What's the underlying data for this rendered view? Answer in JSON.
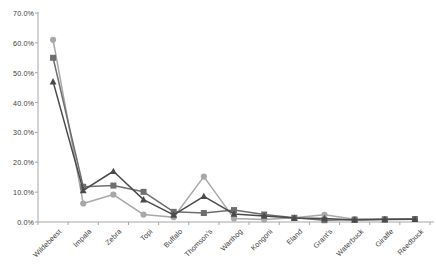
{
  "chart_data": {
    "type": "line",
    "title": "",
    "subtitle": "",
    "xlabel": "",
    "ylabel": "",
    "ylim": [
      0,
      70
    ],
    "ytick_labels": [
      "0.0%",
      "10.0%",
      "20.0%",
      "30.0%",
      "40.0%",
      "50.0%",
      "60.0%",
      "70.0%"
    ],
    "ytick_values": [
      0,
      10,
      20,
      30,
      40,
      50,
      60,
      70
    ],
    "grid": false,
    "legend_position": "none",
    "categories": [
      "Wildebeest",
      "Impala",
      "Zebra",
      "Topi",
      "Buffalo",
      "Thomson's",
      "Warthog",
      "Kongoni",
      "Eland",
      "Grant's",
      "Waterbuck",
      "Giraffe",
      "Reedbuck"
    ],
    "series": [
      {
        "name": "series-1",
        "marker": "circle",
        "color": "#a8a8a8",
        "values": [
          61.0,
          6.2,
          9.2,
          2.5,
          1.6,
          15.2,
          1.2,
          0.8,
          1.4,
          2.4,
          0.9,
          1.0,
          1.0
        ]
      },
      {
        "name": "series-2",
        "marker": "square",
        "color": "#6e6e6e",
        "values": [
          55.0,
          11.8,
          12.2,
          10.1,
          3.4,
          3.0,
          4.0,
          2.5,
          1.4,
          0.6,
          0.8,
          0.9,
          1.0
        ]
      },
      {
        "name": "series-3",
        "marker": "triangle",
        "color": "#4a4a4a",
        "values": [
          47.0,
          10.6,
          17.0,
          7.5,
          2.4,
          8.6,
          2.7,
          2.0,
          1.3,
          1.2,
          0.7,
          0.8,
          0.9
        ]
      }
    ]
  },
  "axis": {
    "domain_color": "#a6a6a6",
    "tick_color": "#a6a6a6"
  }
}
